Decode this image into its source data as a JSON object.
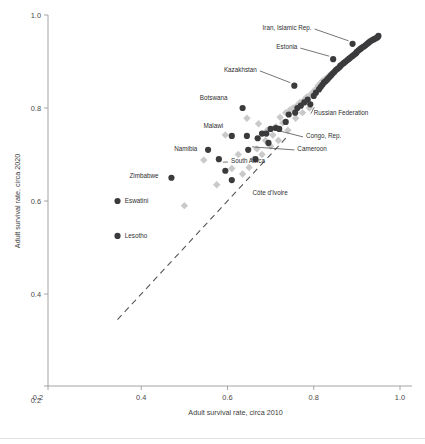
{
  "chart_data": {
    "type": "scatter",
    "title": "",
    "subtitle": "",
    "xlabel": "Adult survival rate, circa 2010",
    "ylabel": "Adult survival rate, circa 2020",
    "xlim": [
      0.2,
      1.0
    ],
    "ylim": [
      0.2,
      1.0
    ],
    "xticks": [
      0.2,
      0.4,
      0.6,
      0.8,
      1.0
    ],
    "yticks": [
      0.2,
      0.4,
      0.6,
      0.8,
      1.0
    ],
    "xticklabels": [
      "0.2",
      "0.4",
      "0.6",
      "0.8",
      "1.0"
    ],
    "yticklabels": [
      "0.2",
      "0.4",
      "0.6",
      "0.8",
      "1.0"
    ],
    "grid": false,
    "legend": "none",
    "reference_line": {
      "name": "identity-line",
      "style": "dashed",
      "from": [
        0.345,
        0.345
      ],
      "to": [
        0.735,
        0.735
      ]
    },
    "series": [
      {
        "name": "Male adult survival",
        "marker": "circle",
        "color": "#3b3b3d",
        "points": [
          [
            0.345,
            0.525
          ],
          [
            0.345,
            0.6
          ],
          [
            0.47,
            0.65
          ],
          [
            0.555,
            0.71
          ],
          [
            0.58,
            0.69
          ],
          [
            0.595,
            0.665
          ],
          [
            0.61,
            0.74
          ],
          [
            0.61,
            0.645
          ],
          [
            0.635,
            0.8
          ],
          [
            0.645,
            0.74
          ],
          [
            0.648,
            0.71
          ],
          [
            0.665,
            0.69
          ],
          [
            0.67,
            0.735
          ],
          [
            0.68,
            0.745
          ],
          [
            0.69,
            0.745
          ],
          [
            0.695,
            0.725
          ],
          [
            0.7,
            0.755
          ],
          [
            0.712,
            0.757
          ],
          [
            0.72,
            0.755
          ],
          [
            0.735,
            0.77
          ],
          [
            0.742,
            0.786
          ],
          [
            0.755,
            0.848
          ],
          [
            0.757,
            0.79
          ],
          [
            0.762,
            0.8
          ],
          [
            0.77,
            0.805
          ],
          [
            0.778,
            0.812
          ],
          [
            0.786,
            0.818
          ],
          [
            0.792,
            0.808
          ],
          [
            0.8,
            0.826
          ],
          [
            0.805,
            0.833
          ],
          [
            0.812,
            0.84
          ],
          [
            0.816,
            0.845
          ],
          [
            0.82,
            0.85
          ],
          [
            0.824,
            0.855
          ],
          [
            0.828,
            0.858
          ],
          [
            0.832,
            0.862
          ],
          [
            0.836,
            0.866
          ],
          [
            0.84,
            0.87
          ],
          [
            0.844,
            0.874
          ],
          [
            0.845,
            0.905
          ],
          [
            0.848,
            0.878
          ],
          [
            0.852,
            0.882
          ],
          [
            0.856,
            0.885
          ],
          [
            0.86,
            0.888
          ],
          [
            0.862,
            0.891
          ],
          [
            0.866,
            0.894
          ],
          [
            0.87,
            0.897
          ],
          [
            0.874,
            0.9
          ],
          [
            0.878,
            0.903
          ],
          [
            0.882,
            0.906
          ],
          [
            0.886,
            0.909
          ],
          [
            0.89,
            0.912
          ],
          [
            0.89,
            0.938
          ],
          [
            0.894,
            0.915
          ],
          [
            0.898,
            0.918
          ],
          [
            0.9,
            0.921
          ],
          [
            0.904,
            0.924
          ],
          [
            0.908,
            0.927
          ],
          [
            0.912,
            0.93
          ],
          [
            0.916,
            0.932
          ],
          [
            0.92,
            0.935
          ],
          [
            0.924,
            0.938
          ],
          [
            0.928,
            0.941
          ],
          [
            0.932,
            0.944
          ],
          [
            0.936,
            0.946
          ],
          [
            0.94,
            0.948
          ],
          [
            0.944,
            0.95
          ],
          [
            0.948,
            0.952
          ],
          [
            0.95,
            0.955
          ]
        ]
      },
      {
        "name": "Female adult survival",
        "marker": "diamond",
        "color": "#c9c9c9",
        "points": [
          [
            0.5,
            0.59
          ],
          [
            0.545,
            0.688
          ],
          [
            0.575,
            0.635
          ],
          [
            0.595,
            0.742
          ],
          [
            0.61,
            0.67
          ],
          [
            0.625,
            0.7
          ],
          [
            0.635,
            0.658
          ],
          [
            0.645,
            0.778
          ],
          [
            0.65,
            0.672
          ],
          [
            0.66,
            0.69
          ],
          [
            0.668,
            0.712
          ],
          [
            0.672,
            0.766
          ],
          [
            0.68,
            0.7
          ],
          [
            0.688,
            0.73
          ],
          [
            0.692,
            0.752
          ],
          [
            0.7,
            0.718
          ],
          [
            0.705,
            0.742
          ],
          [
            0.712,
            0.76
          ],
          [
            0.718,
            0.73
          ],
          [
            0.722,
            0.78
          ],
          [
            0.728,
            0.768
          ],
          [
            0.735,
            0.79
          ],
          [
            0.74,
            0.752
          ],
          [
            0.745,
            0.796
          ],
          [
            0.752,
            0.8
          ],
          [
            0.758,
            0.778
          ],
          [
            0.762,
            0.806
          ],
          [
            0.768,
            0.812
          ],
          [
            0.774,
            0.79
          ],
          [
            0.778,
            0.818
          ],
          [
            0.784,
            0.824
          ],
          [
            0.79,
            0.8
          ],
          [
            0.794,
            0.83
          ],
          [
            0.8,
            0.836
          ],
          [
            0.806,
            0.842
          ],
          [
            0.81,
            0.848
          ],
          [
            0.816,
            0.854
          ],
          [
            0.82,
            0.858
          ],
          [
            0.826,
            0.862
          ],
          [
            0.832,
            0.866
          ],
          [
            0.836,
            0.87
          ],
          [
            0.842,
            0.874
          ],
          [
            0.846,
            0.878
          ],
          [
            0.852,
            0.882
          ],
          [
            0.856,
            0.886
          ],
          [
            0.862,
            0.89
          ],
          [
            0.866,
            0.894
          ],
          [
            0.872,
            0.898
          ],
          [
            0.876,
            0.901
          ],
          [
            0.882,
            0.905
          ],
          [
            0.886,
            0.908
          ],
          [
            0.892,
            0.912
          ],
          [
            0.896,
            0.916
          ],
          [
            0.902,
            0.92
          ],
          [
            0.906,
            0.924
          ],
          [
            0.912,
            0.928
          ],
          [
            0.916,
            0.932
          ],
          [
            0.922,
            0.936
          ],
          [
            0.926,
            0.94
          ],
          [
            0.932,
            0.944
          ],
          [
            0.936,
            0.947
          ],
          [
            0.942,
            0.95
          ]
        ]
      }
    ],
    "annotations": [
      {
        "label": "Iran, Islamic Rep.",
        "point": [
          0.89,
          0.938
        ],
        "text_xy": [
          0.795,
          0.972
        ],
        "anchor": "end",
        "leader": true
      },
      {
        "label": "Estonia",
        "point": [
          0.845,
          0.905
        ],
        "text_xy": [
          0.762,
          0.931
        ],
        "anchor": "end",
        "leader": true
      },
      {
        "label": "Kazakhstan",
        "point": [
          0.755,
          0.848
        ],
        "text_xy": [
          0.668,
          0.882
        ],
        "anchor": "end",
        "leader": true
      },
      {
        "label": "Botswana",
        "point": [
          0.635,
          0.8
        ],
        "text_xy": [
          0.6,
          0.823
        ],
        "anchor": "end",
        "leader": false
      },
      {
        "label": "Russian Federation",
        "point": [
          0.792,
          0.808
        ],
        "text_xy": [
          0.8,
          0.79
        ],
        "anchor": "start",
        "leader": true
      },
      {
        "label": "Malawi",
        "point": [
          0.61,
          0.74
        ],
        "text_xy": [
          0.59,
          0.762
        ],
        "anchor": "end",
        "leader": false
      },
      {
        "label": "Congo, Rep.",
        "point": [
          0.712,
          0.757
        ],
        "text_xy": [
          0.782,
          0.74
        ],
        "anchor": "start",
        "leader": true
      },
      {
        "label": "Namibia",
        "point": [
          0.555,
          0.71
        ],
        "text_xy": [
          0.53,
          0.712
        ],
        "anchor": "end",
        "leader": false
      },
      {
        "label": "Cameroon",
        "point": [
          0.648,
          0.71
        ],
        "text_xy": [
          0.762,
          0.712
        ],
        "anchor": "start",
        "leader": true
      },
      {
        "label": "South Africa",
        "point": [
          0.58,
          0.69
        ],
        "text_xy": [
          0.608,
          0.686
        ],
        "anchor": "start",
        "leader": true
      },
      {
        "label": "Zimbabwe",
        "point": [
          0.47,
          0.65
        ],
        "text_xy": [
          0.44,
          0.654
        ],
        "anchor": "end",
        "leader": false
      },
      {
        "label": "Eswatini",
        "point": [
          0.345,
          0.6
        ],
        "text_xy": [
          0.362,
          0.6
        ],
        "anchor": "start",
        "leader": false
      },
      {
        "label": "Côte d'Ivoire",
        "point": [
          0.61,
          0.645
        ],
        "text_xy": [
          0.658,
          0.618
        ],
        "anchor": "start",
        "leader": false
      },
      {
        "label": "Lesotho",
        "point": [
          0.345,
          0.525
        ],
        "text_xy": [
          0.362,
          0.525
        ],
        "anchor": "start",
        "leader": false
      }
    ]
  },
  "axes": {
    "x_title": "Adult survival rate, circa 2010",
    "y_title": "Adult survival rate, circa 2020"
  }
}
